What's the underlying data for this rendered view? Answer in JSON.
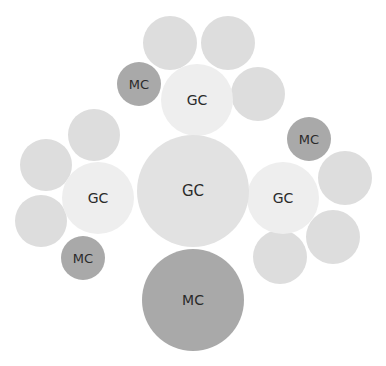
{
  "diagram": {
    "title": "",
    "colors": {
      "background": "#ffffff",
      "gc_center": "#e2e2e2",
      "gc_satellite": "#eeeeee",
      "neighbor": "#dddddd",
      "mc": "#a9a9a9",
      "text": "#2a2a2a"
    },
    "nodes": [
      {
        "id": "gc-center",
        "label": "GC",
        "type": "gc_center",
        "cx": 193,
        "cy": 191,
        "r": 56,
        "font": 15
      },
      {
        "id": "mc-bottom",
        "label": "MC",
        "type": "mc",
        "cx": 193,
        "cy": 300,
        "r": 51,
        "font": 14
      },
      {
        "id": "gc-top",
        "label": "GC",
        "type": "gc_satellite",
        "cx": 197,
        "cy": 100,
        "r": 36,
        "font": 14
      },
      {
        "id": "gc-left",
        "label": "GC",
        "type": "gc_satellite",
        "cx": 98,
        "cy": 198,
        "r": 36,
        "font": 14
      },
      {
        "id": "gc-right",
        "label": "GC",
        "type": "gc_satellite",
        "cx": 283,
        "cy": 198,
        "r": 36,
        "font": 14
      },
      {
        "id": "mc-top-left",
        "label": "MC",
        "type": "mc",
        "cx": 139,
        "cy": 84,
        "r": 22,
        "font": 13
      },
      {
        "id": "mc-left",
        "label": "MC",
        "type": "mc",
        "cx": 83,
        "cy": 258,
        "r": 22,
        "font": 13
      },
      {
        "id": "mc-right",
        "label": "MC",
        "type": "mc",
        "cx": 309,
        "cy": 139,
        "r": 22,
        "font": 13
      },
      {
        "id": "n-top-1",
        "label": "",
        "type": "neighbor",
        "cx": 170,
        "cy": 43,
        "r": 27
      },
      {
        "id": "n-top-2",
        "label": "",
        "type": "neighbor",
        "cx": 228,
        "cy": 43,
        "r": 27
      },
      {
        "id": "n-top-3",
        "label": "",
        "type": "neighbor",
        "cx": 258,
        "cy": 94,
        "r": 27
      },
      {
        "id": "n-left-1",
        "label": "",
        "type": "neighbor",
        "cx": 94,
        "cy": 135,
        "r": 26
      },
      {
        "id": "n-left-2",
        "label": "",
        "type": "neighbor",
        "cx": 46,
        "cy": 165,
        "r": 26
      },
      {
        "id": "n-left-3",
        "label": "",
        "type": "neighbor",
        "cx": 41,
        "cy": 221,
        "r": 26
      },
      {
        "id": "n-right-1",
        "label": "",
        "type": "neighbor",
        "cx": 345,
        "cy": 178,
        "r": 27
      },
      {
        "id": "n-right-2",
        "label": "",
        "type": "neighbor",
        "cx": 333,
        "cy": 237,
        "r": 27
      },
      {
        "id": "n-right-3",
        "label": "",
        "type": "neighbor",
        "cx": 280,
        "cy": 257,
        "r": 27
      }
    ]
  }
}
